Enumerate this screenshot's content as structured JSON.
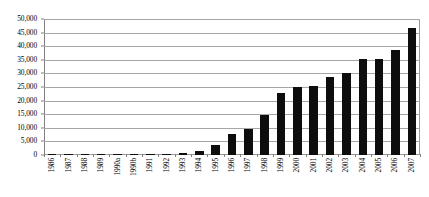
{
  "chart_data": {
    "type": "bar",
    "title": "",
    "subtitle": "",
    "xlabel": "",
    "ylabel": "",
    "ylim": [
      0,
      50000
    ],
    "ytick_labels": [
      "50,000",
      "45,000",
      "40,000",
      "35,000",
      "30,000",
      "25,000",
      "20,000",
      "15,000",
      "10,000",
      "5,000",
      "0"
    ],
    "ytick_values": [
      50000,
      45000,
      40000,
      35000,
      30000,
      25000,
      20000,
      15000,
      10000,
      5000,
      0
    ],
    "grid": true,
    "legend": "none",
    "bar_color": "#0d0d0d",
    "categories": [
      "1986",
      "1987",
      "1988",
      "1989",
      "1990a",
      "1990b",
      "1991",
      "1992",
      "1993",
      "1994",
      "1995",
      "1996",
      "1997",
      "1998",
      "1999",
      "2000",
      "2001",
      "2002",
      "2003",
      "2004",
      "2005",
      "2006",
      "2007"
    ],
    "values": [
      60,
      120,
      130,
      180,
      500,
      90,
      150,
      330,
      700,
      1650,
      3800,
      7700,
      9700,
      14700,
      22700,
      25100,
      25300,
      28700,
      30200,
      35400,
      35200,
      38700,
      46800
    ]
  }
}
